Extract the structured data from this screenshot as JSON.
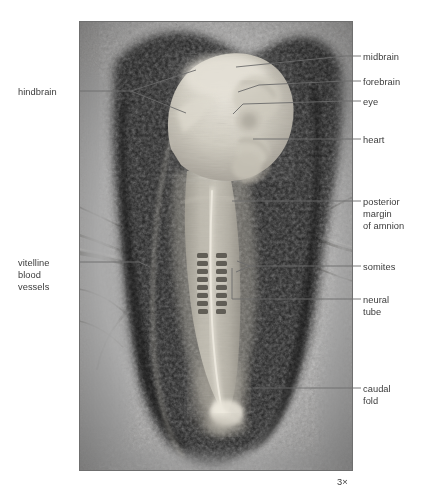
{
  "figure": {
    "magnification": "3×",
    "photo": {
      "x": 79,
      "y": 21,
      "width": 274,
      "height": 450,
      "border_color": "#6f6f6f",
      "background_tone": "#9d9d9d",
      "description": "Grayscale photomicrograph of a chick embryo in dorsal view lying on the yolk sac, surrounded by a dark opaque area vasculosa ring; the pale translucent embryo runs head-up down the center of the frame."
    }
  },
  "colors": {
    "text": "#3b3b3b",
    "leader_line": "#6b6b6b",
    "page_background": "#ffffff",
    "photo_dark_area": "#171717",
    "photo_mid_tone": "#8e8e8e",
    "photo_light_tone": "#c9c9c9",
    "embryo_pale": "#d5d2c8"
  },
  "labels": [
    {
      "id": "midbrain",
      "text": "midbrain",
      "side": "right",
      "x": 363,
      "y": 52,
      "lines": 1
    },
    {
      "id": "forebrain",
      "text": "forebrain",
      "side": "right",
      "x": 363,
      "y": 77,
      "lines": 1
    },
    {
      "id": "eye",
      "text": "eye",
      "side": "right",
      "x": 363,
      "y": 97,
      "lines": 1
    },
    {
      "id": "heart",
      "text": "heart",
      "side": "right",
      "x": 363,
      "y": 135,
      "lines": 1
    },
    {
      "id": "posterior-margin-of-amnion",
      "text": "posterior\nmargin\nof amnion",
      "side": "right",
      "x": 363,
      "y": 197,
      "lines": 3
    },
    {
      "id": "somites",
      "text": "somites",
      "side": "right",
      "x": 363,
      "y": 262,
      "lines": 1
    },
    {
      "id": "neural-tube",
      "text": "neural\ntube",
      "side": "right",
      "x": 363,
      "y": 295,
      "lines": 2
    },
    {
      "id": "caudal-fold",
      "text": "caudal\nfold",
      "side": "right",
      "x": 363,
      "y": 384,
      "lines": 2
    },
    {
      "id": "hindbrain",
      "text": "hindbrain",
      "side": "left",
      "x": 18,
      "y": 87,
      "lines": 1
    },
    {
      "id": "vitelline-blood-vessels",
      "text": "vitelline\nblood\nvessels",
      "side": "left",
      "x": 18,
      "y": 258,
      "lines": 3
    }
  ],
  "leaders": [
    {
      "id": "leader-midbrain",
      "points": "361,56 345,56 236,67"
    },
    {
      "id": "leader-forebrain",
      "points": "361,81 345,81 259,85 238,92"
    },
    {
      "id": "leader-eye",
      "points": "361,101 345,101 243,104 233,114"
    },
    {
      "id": "leader-heart",
      "points": "361,139 345,139 253,139"
    },
    {
      "id": "leader-amnion",
      "points": "361,201 345,201 232,201"
    },
    {
      "id": "leader-somites-a",
      "points": "361,266 250,266 237,261"
    },
    {
      "id": "leader-somites-b",
      "points": "250,266 236,272"
    },
    {
      "id": "leader-neural",
      "points": "361,299 232,299 232,268"
    },
    {
      "id": "leader-caudal",
      "points": "361,388 253,388"
    },
    {
      "id": "leader-hindbrain-stem",
      "points": "80,91 131,91"
    },
    {
      "id": "leader-hindbrain-a",
      "points": "131,91 196,70"
    },
    {
      "id": "leader-hindbrain-b",
      "points": "131,91 186,113"
    },
    {
      "id": "leader-vitelline",
      "points": "80,262 139,262 150,267"
    }
  ],
  "scale": {
    "text": "3×",
    "x": 337,
    "y": 477
  }
}
